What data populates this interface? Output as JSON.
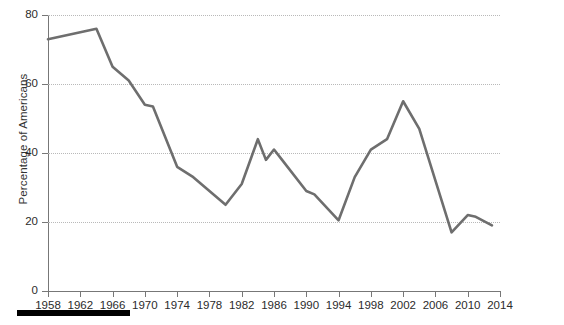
{
  "chart_data": {
    "type": "line",
    "title": "",
    "xlabel": "",
    "ylabel": "Percentage of Americans",
    "xlim": [
      1958,
      2014
    ],
    "ylim": [
      0,
      80
    ],
    "grid": true,
    "legend": null,
    "line_color": "#6e6e6e",
    "x_tick_labels": [
      "1958",
      "1962",
      "1966",
      "1970",
      "1974",
      "1978",
      "1982",
      "1986",
      "1990",
      "1994",
      "1998",
      "2002",
      "2006",
      "2010",
      "2014"
    ],
    "x_ticks": [
      1958,
      1962,
      1966,
      1970,
      1974,
      1978,
      1982,
      1986,
      1990,
      1994,
      1998,
      2002,
      2006,
      2010,
      2014
    ],
    "y_tick_labels": [
      "0",
      "20",
      "40",
      "60",
      "80"
    ],
    "y_ticks": [
      0,
      20,
      40,
      60,
      80
    ],
    "series": [
      {
        "name": "Percentage of Americans",
        "x": [
          1958,
          1964,
          1966,
          1968,
          1970,
          1971,
          1974,
          1976,
          1980,
          1982,
          1984,
          1985,
          1986,
          1987,
          1990,
          1991,
          1994,
          1996,
          1998,
          2000,
          2002,
          2004,
          2008,
          2010,
          2011,
          2013
        ],
        "values": [
          73,
          76,
          65,
          61,
          54,
          53.5,
          36,
          33,
          25,
          31,
          44,
          38,
          41,
          38,
          29,
          28,
          20.5,
          33,
          41,
          44,
          55,
          47,
          17,
          22,
          21.5,
          19
        ]
      }
    ]
  },
  "footer": {
    "bar_present": true,
    "bar_color": "#000000"
  }
}
